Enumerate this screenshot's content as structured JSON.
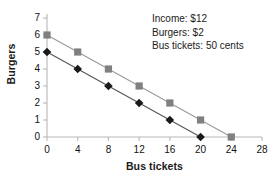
{
  "chart_data": {
    "type": "line",
    "title": "",
    "xlabel": "Bus tickets",
    "ylabel": "Burgers",
    "xlim": [
      0,
      28
    ],
    "ylim": [
      0,
      7
    ],
    "xticks": [
      0,
      4,
      8,
      12,
      16,
      20,
      24,
      28
    ],
    "yticks": [
      0,
      1,
      2,
      3,
      4,
      5,
      6,
      7
    ],
    "grid": false,
    "legend": "none",
    "series": [
      {
        "name": "Budget line (outer)",
        "marker": "square",
        "color": "#808080",
        "line_color": "#9a9a9a",
        "x": [
          0,
          4,
          8,
          12,
          16,
          20,
          24
        ],
        "values": [
          6,
          5,
          4,
          3,
          2,
          1,
          0
        ]
      },
      {
        "name": "Budget line (inner)",
        "marker": "diamond",
        "color": "#1a1a1a",
        "line_color": "#555555",
        "x": [
          0,
          4,
          8,
          12,
          16,
          20
        ],
        "values": [
          5,
          4,
          3,
          2,
          1,
          0
        ]
      }
    ],
    "annotations": [
      "Income: $12",
      "Burgers: $2",
      "Bus tickets: 50 cents"
    ]
  },
  "caption": "",
  "colors": {
    "axis": "#b8b8b8",
    "text": "#1a1a1a",
    "square_series": "#808080",
    "diamond_series": "#1a1a1a"
  }
}
